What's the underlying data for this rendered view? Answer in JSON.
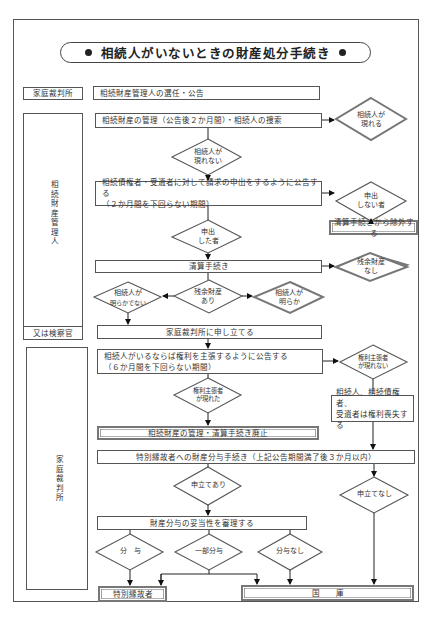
{
  "title": "相続人がいないときの財産処分手続き",
  "left_column": {
    "court_top": "家庭裁判所",
    "administrator": "相続財産管理人",
    "prosecutor": "又は検察官",
    "court_bottom": "家庭裁判所"
  },
  "steps": {
    "appointment": "相続財産管理人の選任・公告",
    "management": "相続財産の管理（公告後２か月間）・相続人の捜索",
    "notice_creditors_line1": "相続債権者・受遺者に対して請求の申出をするように公告する",
    "notice_creditors_line2": "（２か月間を下回らない期間）",
    "excluded": "清算手続きから除外する",
    "liquidation": "清算手続き",
    "petition_court": "家庭裁判所に申し立てる",
    "notice_heirs_line1": "相続人がいるならば権利を主張するように公告する",
    "notice_heirs_line2": "（６か月間を下回らない期間）",
    "rights_lost_line1": "相続人、相続債権者、",
    "rights_lost_line2": "受遺者は権利喪失する",
    "abolished": "相続財産の管理・清算手続き廃止",
    "special_distribution": "特別縁故者への財産分与手続き（上記公告期間満了後３か月以内）",
    "review": "財産分与の妥当性を審理する",
    "special_person": "特別縁故者",
    "national_treasury": "国　　庫"
  },
  "decisions": {
    "heir_appears_l1": "相続人が",
    "heir_appears_l2": "現れる",
    "heir_not_appear_l1": "相続人が",
    "heir_not_appear_l2": "現れない",
    "not_claimed_l1": "申出",
    "not_claimed_l2": "しない者",
    "claimed_l1": "申出",
    "claimed_l2": "した者",
    "no_residual_l1": "残余財産",
    "no_residual_l2": "なし",
    "residual_l1": "残余財産",
    "residual_l2": "あり",
    "heir_unclear_l1": "相続人が",
    "heir_unclear_l2": "明らかでない",
    "heir_clear_l1": "相続人が",
    "heir_clear_l2": "明らか",
    "claimant_none_l1": "権利主張者",
    "claimant_none_l2": "が現れない",
    "claimant_appeared_l1": "権利主張者",
    "claimant_appeared_l2": "が現れた",
    "petition_yes": "申立てあり",
    "petition_no": "申立てなし",
    "grant": "分　与",
    "partial_grant": "一部分与",
    "no_grant": "分与なし"
  }
}
